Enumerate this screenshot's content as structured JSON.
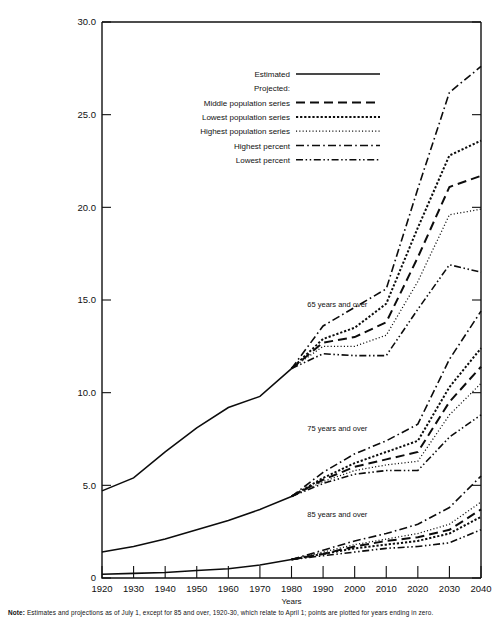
{
  "figure": {
    "axis_title_x": "Years",
    "note_prefix": "Note:",
    "note_body": "Estimates and projections as of July 1, except for 85 and over, 1920-30, which relate to April 1; points are plotted for years ending in zero."
  },
  "legend": {
    "entries": [
      {
        "label": "Estimated",
        "style": "solid"
      },
      {
        "label": "Projected:",
        "style": "none"
      },
      {
        "label": "Middle population series",
        "style": "dashed"
      },
      {
        "label": "Lowest population series",
        "style": "dotted-coarse"
      },
      {
        "label": "Highest population series",
        "style": "dotted-fine"
      },
      {
        "label": "Highest percent",
        "style": "dash-dot"
      },
      {
        "label": "Lowest percent",
        "style": "dash-dot-dot"
      }
    ]
  },
  "chart_data": {
    "type": "line",
    "title": "",
    "subtitle": "",
    "xlabel": "Years",
    "ylabel": "",
    "xlim": [
      1920,
      2040
    ],
    "ylim": [
      0,
      30
    ],
    "grid": false,
    "legend_position": "top-center",
    "xticks": [
      1920,
      1930,
      1940,
      1950,
      1960,
      1970,
      1980,
      1990,
      2000,
      2010,
      2020,
      2030,
      2040
    ],
    "xtick_labels": [
      "1920",
      "1930",
      "1940",
      "1950",
      "1960",
      "1970",
      "1980",
      "1990",
      "2000",
      "2010",
      "2020",
      "2030",
      "2040"
    ],
    "yticks": [
      0,
      5,
      10,
      15,
      20,
      25,
      30
    ],
    "ytick_labels": [
      "0",
      "5.0",
      "10.0",
      "15.0",
      "20.0",
      "25.0",
      "30.0"
    ],
    "annotations": [
      {
        "text": "65 years and over",
        "x": 1985,
        "y": 14.6
      },
      {
        "text": "75 years and over",
        "x": 1985,
        "y": 7.95
      },
      {
        "text": "85 years and over",
        "x": 1985,
        "y": 3.3
      }
    ],
    "groups": [
      {
        "name": "65 years and over",
        "series": [
          {
            "name": "Estimated",
            "style": "solid",
            "x": [
              1920,
              1930,
              1940,
              1950,
              1960,
              1970,
              1980
            ],
            "values": [
              4.7,
              5.4,
              6.8,
              8.1,
              9.2,
              9.8,
              11.3
            ]
          },
          {
            "name": "Middle population series",
            "style": "dashed",
            "x": [
              1980,
              1990,
              2000,
              2010,
              2020,
              2030,
              2040
            ],
            "values": [
              11.3,
              12.7,
              13.0,
              13.8,
              17.3,
              21.1,
              21.7
            ]
          },
          {
            "name": "Lowest population series",
            "style": "dotted-coarse",
            "x": [
              1980,
              1990,
              2000,
              2010,
              2020,
              2030,
              2040
            ],
            "values": [
              11.3,
              12.9,
              13.5,
              14.8,
              18.9,
              22.8,
              23.6
            ]
          },
          {
            "name": "Highest population series",
            "style": "dotted-fine",
            "x": [
              1980,
              1990,
              2000,
              2010,
              2020,
              2030,
              2040
            ],
            "values": [
              11.3,
              12.5,
              12.5,
              13.1,
              16.0,
              19.6,
              19.9
            ]
          },
          {
            "name": "Highest percent",
            "style": "dash-dot",
            "x": [
              1980,
              1990,
              2000,
              2010,
              2020,
              2030,
              2040
            ],
            "values": [
              11.3,
              13.6,
              14.6,
              15.6,
              21.0,
              26.2,
              27.6
            ]
          },
          {
            "name": "Lowest percent",
            "style": "dash-dot-dot",
            "x": [
              1980,
              1990,
              2000,
              2010,
              2020,
              2030,
              2040
            ],
            "values": [
              11.3,
              12.1,
              12.0,
              12.0,
              14.5,
              16.9,
              16.5
            ]
          }
        ]
      },
      {
        "name": "75 years and over",
        "series": [
          {
            "name": "Estimated",
            "style": "solid",
            "x": [
              1920,
              1930,
              1940,
              1950,
              1960,
              1970,
              1980
            ],
            "values": [
              1.4,
              1.7,
              2.1,
              2.6,
              3.1,
              3.7,
              4.4
            ]
          },
          {
            "name": "Middle population series",
            "style": "dashed",
            "x": [
              1980,
              1990,
              2000,
              2010,
              2020,
              2030,
              2040
            ],
            "values": [
              4.4,
              5.3,
              6.0,
              6.4,
              6.8,
              9.5,
              11.4
            ]
          },
          {
            "name": "Lowest population series",
            "style": "dotted-coarse",
            "x": [
              1980,
              1990,
              2000,
              2010,
              2020,
              2030,
              2040
            ],
            "values": [
              4.4,
              5.4,
              6.2,
              6.8,
              7.4,
              10.3,
              12.4
            ]
          },
          {
            "name": "Highest population series",
            "style": "dotted-fine",
            "x": [
              1980,
              1990,
              2000,
              2010,
              2020,
              2030,
              2040
            ],
            "values": [
              4.4,
              5.2,
              5.8,
              6.1,
              6.3,
              8.8,
              10.5
            ]
          },
          {
            "name": "Highest percent",
            "style": "dash-dot",
            "x": [
              1980,
              1990,
              2000,
              2010,
              2020,
              2030,
              2040
            ],
            "values": [
              4.4,
              5.7,
              6.7,
              7.4,
              8.3,
              11.8,
              14.4
            ]
          },
          {
            "name": "Lowest percent",
            "style": "dash-dot-dot",
            "x": [
              1980,
              1990,
              2000,
              2010,
              2020,
              2030,
              2040
            ],
            "values": [
              4.4,
              5.1,
              5.6,
              5.8,
              5.8,
              7.6,
              8.8
            ]
          }
        ]
      },
      {
        "name": "85 years and over",
        "series": [
          {
            "name": "Estimated",
            "style": "solid",
            "x": [
              1920,
              1930,
              1940,
              1950,
              1960,
              1970,
              1980
            ],
            "values": [
              0.2,
              0.25,
              0.3,
              0.4,
              0.5,
              0.7,
              1.0
            ]
          },
          {
            "name": "Middle population series",
            "style": "dashed",
            "x": [
              1980,
              1990,
              2000,
              2010,
              2020,
              2030,
              2040
            ],
            "values": [
              1.0,
              1.3,
              1.7,
              2.0,
              2.2,
              2.6,
              3.7
            ]
          },
          {
            "name": "Lowest population series",
            "style": "dotted-coarse",
            "x": [
              1980,
              1990,
              2000,
              2010,
              2020,
              2030,
              2040
            ],
            "values": [
              1.0,
              1.3,
              1.6,
              1.8,
              2.0,
              2.4,
              3.3
            ]
          },
          {
            "name": "Highest population series",
            "style": "dotted-fine",
            "x": [
              1980,
              1990,
              2000,
              2010,
              2020,
              2030,
              2040
            ],
            "values": [
              1.0,
              1.4,
              1.8,
              2.1,
              2.4,
              2.9,
              4.1
            ]
          },
          {
            "name": "Highest percent",
            "style": "dash-dot",
            "x": [
              1980,
              1990,
              2000,
              2010,
              2020,
              2030,
              2040
            ],
            "values": [
              1.0,
              1.5,
              2.0,
              2.4,
              2.9,
              3.8,
              5.5
            ]
          },
          {
            "name": "Lowest percent",
            "style": "dash-dot-dot",
            "x": [
              1980,
              1990,
              2000,
              2010,
              2020,
              2030,
              2040
            ],
            "values": [
              1.0,
              1.2,
              1.4,
              1.6,
              1.7,
              1.9,
              2.6
            ]
          }
        ]
      }
    ]
  }
}
